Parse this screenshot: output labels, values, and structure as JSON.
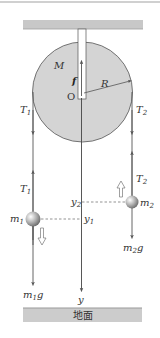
{
  "diagram": {
    "type": "pulley-atwood-machine",
    "colors": {
      "ceiling": "#c8c8c8",
      "ceiling_edge": "#a0a0a0",
      "pulley_fill": "#d4d4d4",
      "pulley_stroke": "#555555",
      "string": "#555555",
      "ball_light": "#ffffff",
      "ball_dark": "#777777",
      "ground": "#cccccc",
      "ground_edge": "#999999",
      "dashed": "#666666"
    },
    "pulley": {
      "mass_label": "M",
      "radius_label": "R",
      "center_label": "O",
      "friction_label": "f"
    },
    "left_side": {
      "tension_top": {
        "main": "T",
        "sub": "1"
      },
      "tension_bottom": {
        "main": "T",
        "sub": "1"
      },
      "mass": {
        "main": "m",
        "sub": "1"
      },
      "weight": {
        "main": "m",
        "sub": "1",
        "tail": "g"
      },
      "position": {
        "main": "y",
        "sub": "1"
      },
      "motion_direction": "down"
    },
    "right_side": {
      "tension_top": {
        "main": "T",
        "sub": "2"
      },
      "tension_bottom": {
        "main": "T",
        "sub": "2"
      },
      "mass": {
        "main": "m",
        "sub": "2"
      },
      "weight": {
        "main": "m",
        "sub": "2",
        "tail": "g"
      },
      "position": {
        "main": "y",
        "sub": "2"
      },
      "motion_direction": "up"
    },
    "axis": {
      "label": "y"
    },
    "ground": {
      "label": "地面"
    }
  }
}
